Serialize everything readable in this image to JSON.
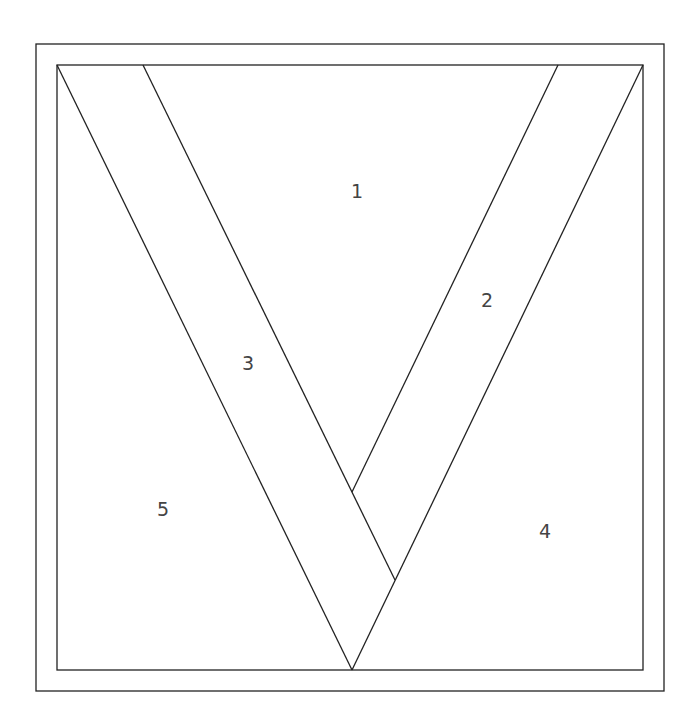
{
  "diagram": {
    "stroke_color": "#222222",
    "label_color": "#444444",
    "outer_frame": {
      "x": 36,
      "y": 44,
      "w": 628,
      "h": 647
    },
    "inner_frame": {
      "x": 57,
      "y": 65,
      "w": 586,
      "h": 605
    },
    "pieces": [
      {
        "id": "1",
        "label": "1",
        "x": 357,
        "y": 192
      },
      {
        "id": "2",
        "label": "2",
        "x": 487,
        "y": 301
      },
      {
        "id": "3",
        "label": "3",
        "x": 248,
        "y": 364
      },
      {
        "id": "4",
        "label": "4",
        "x": 545,
        "y": 532
      },
      {
        "id": "5",
        "label": "5",
        "x": 163,
        "y": 510
      }
    ],
    "lines": [
      {
        "x1": 57,
        "y1": 65,
        "x2": 352,
        "y2": 670
      },
      {
        "x1": 143,
        "y1": 65,
        "x2": 395,
        "y2": 580
      },
      {
        "x1": 558,
        "y1": 65,
        "x2": 352,
        "y2": 492
      },
      {
        "x1": 643,
        "y1": 65,
        "x2": 352,
        "y2": 670
      }
    ]
  }
}
